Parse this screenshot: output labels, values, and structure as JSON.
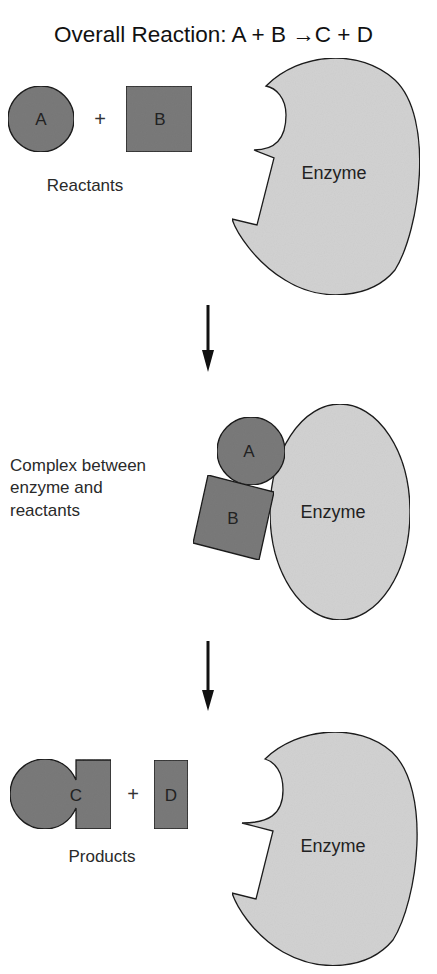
{
  "title": "Overall Reaction: A + B →C + D",
  "title_parts": {
    "prefix": "Overall Reaction:",
    "reactant_a": "A",
    "plus1": "+",
    "reactant_b": "B",
    "arrow": "→",
    "product_c": "C",
    "plus2": "+",
    "product_d": "D"
  },
  "stages": [
    {
      "name": "reactants",
      "label": "Reactants",
      "molecules": [
        {
          "id": "A",
          "label": "A",
          "shape": "circle"
        },
        {
          "id": "B",
          "label": "B",
          "shape": "square"
        }
      ],
      "operator": "+",
      "enzyme_label": "Enzyme"
    },
    {
      "name": "complex",
      "label_lines": [
        "Complex between",
        "enzyme and",
        "reactants"
      ],
      "molecules": [
        {
          "id": "A",
          "label": "A",
          "shape": "circle"
        },
        {
          "id": "B",
          "label": "B",
          "shape": "square"
        }
      ],
      "enzyme_label": "Enzyme"
    },
    {
      "name": "products",
      "label": "Products",
      "molecules": [
        {
          "id": "C",
          "label": "C",
          "shape": "circle-with-block"
        },
        {
          "id": "D",
          "label": "D",
          "shape": "rectangle"
        }
      ],
      "operator": "+",
      "enzyme_label": "Enzyme"
    }
  ],
  "colors": {
    "substrate_fill": "#7a7a7a",
    "enzyme_fill": "#d2d2d2",
    "outline": "#1a1a1a",
    "arrow": "#111111"
  }
}
